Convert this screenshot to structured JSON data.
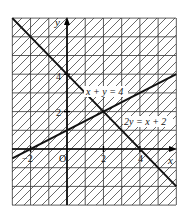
{
  "diagram": {
    "type": "graph-of-linear-inequalities",
    "axes": {
      "x_label": "x",
      "y_label": "y",
      "origin_label": "O",
      "x_range": [
        -3,
        6
      ],
      "y_range": [
        -3,
        7
      ],
      "x_ticks": [
        {
          "value": -2,
          "label": "−2"
        },
        {
          "value": 2,
          "label": "2"
        },
        {
          "value": 4,
          "label": "4"
        }
      ],
      "y_ticks": [
        {
          "value": 2,
          "label": "2"
        },
        {
          "value": 4,
          "label": "4"
        }
      ]
    },
    "lines": [
      {
        "label": "x + y = 4",
        "points": [
          [
            -3,
            7
          ],
          [
            6,
            -2
          ]
        ]
      },
      {
        "label": "2y = x + 2",
        "points": [
          [
            -3,
            -0.5
          ],
          [
            6,
            4
          ]
        ]
      }
    ],
    "grid": {
      "spacing": 1,
      "visible": true
    },
    "shading": "diagonal hatch lines over entire grid",
    "colors": {
      "line": "#111111",
      "grid": "#333333",
      "hatch": "#444444",
      "background": "#ffffff"
    }
  }
}
